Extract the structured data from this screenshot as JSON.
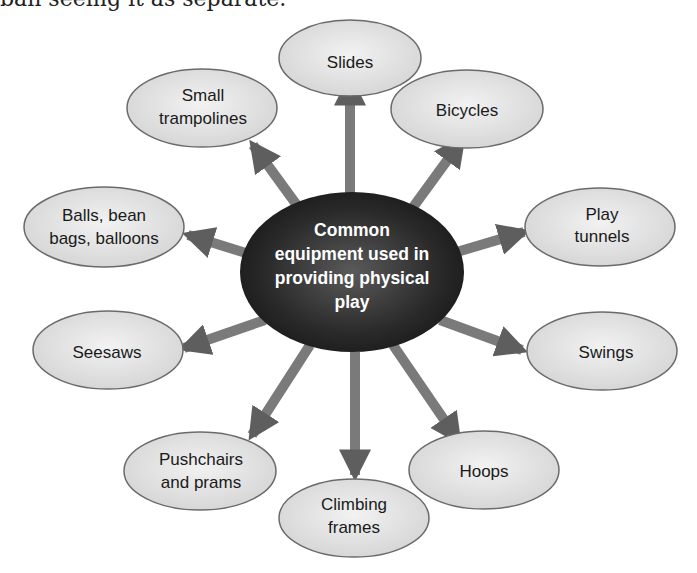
{
  "header": {
    "cut_text": "ban seeing it as separate."
  },
  "diagram": {
    "center": {
      "lines": [
        "Common",
        "equipment used in",
        "providing physical",
        "play"
      ]
    },
    "nodes": [
      {
        "id": "slides",
        "lines": [
          "Slides"
        ]
      },
      {
        "id": "bicycles",
        "lines": [
          "Bicycles"
        ]
      },
      {
        "id": "play-tunnels",
        "lines": [
          "Play",
          "tunnels"
        ]
      },
      {
        "id": "swings",
        "lines": [
          "Swings"
        ]
      },
      {
        "id": "hoops",
        "lines": [
          "Hoops"
        ]
      },
      {
        "id": "climbing-frames",
        "lines": [
          "Climbing",
          "frames"
        ]
      },
      {
        "id": "pushchairs-and-prams",
        "lines": [
          "Pushchairs",
          "and prams"
        ]
      },
      {
        "id": "seesaws",
        "lines": [
          "Seesaws"
        ]
      },
      {
        "id": "balls-bean-bags-balloons",
        "lines": [
          "Balls, bean",
          "bags, balloons"
        ]
      },
      {
        "id": "small-trampolines",
        "lines": [
          "Small",
          "trampolines"
        ]
      }
    ]
  },
  "colors": {
    "node_fill": "#e6e6e6",
    "node_stroke": "#6a6a6a",
    "center_fill": "#2b2b2b",
    "arrow": "#6e6e6e",
    "text": "#1a1a1a"
  }
}
